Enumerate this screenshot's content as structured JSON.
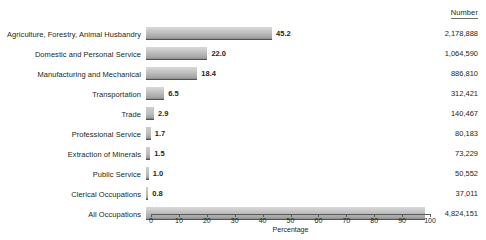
{
  "chart_data": {
    "type": "bar",
    "orientation": "horizontal",
    "title": "",
    "xlabel": "Percentage",
    "ylabel": "",
    "xlim": [
      0,
      100
    ],
    "grid": false,
    "legend": null,
    "number_column_header": "Number",
    "categories": [
      "Agriculture, Forestry, Animal Husbandry",
      "Domestic and Personal Service",
      "Manufacturing and Mechanical",
      "Transportation",
      "Trade",
      "Professional Service",
      "Extraction of Minerals",
      "Public Service",
      "Clerical Occupations",
      "All Occupations"
    ],
    "values": [
      45.2,
      22.0,
      18.4,
      6.5,
      2.9,
      1.7,
      1.5,
      1.0,
      0.8,
      100.0
    ],
    "value_labels": [
      "45.2",
      "22.0",
      "18.4",
      "6.5",
      "2.9",
      "1.7",
      "1.5",
      "1.0",
      "0.8",
      ""
    ],
    "numbers": [
      "2,178,888",
      "1,064,590",
      "886,810",
      "312,421",
      "140,467",
      "80,183",
      "73,229",
      "50,552",
      "37,011",
      "4,824,151"
    ],
    "xticks": [
      0,
      10,
      20,
      30,
      40,
      50,
      60,
      70,
      80,
      90,
      100
    ],
    "xtick_labels": [
      "0",
      "10",
      "20",
      "30",
      "40",
      "50",
      "60",
      "70",
      "80",
      "90",
      "100"
    ],
    "bar_color_top": "#d9d9d9",
    "bar_color_bottom": "#4a4a4a",
    "text_color": "#231f20",
    "axis_color": "#58595b"
  },
  "rows": [
    {
      "label": "Agriculture, Forestry, Animal Husbandry",
      "value": 45.2,
      "value_label": "45.2",
      "number": "2,178,888"
    },
    {
      "label": "Domestic and Personal Service",
      "value": 22.0,
      "value_label": "22.0",
      "number": "1,064,590"
    },
    {
      "label": "Manufacturing and Mechanical",
      "value": 18.4,
      "value_label": "18.4",
      "number": "886,810"
    },
    {
      "label": "Transportation",
      "value": 6.5,
      "value_label": "6.5",
      "number": "312,421"
    },
    {
      "label": "Trade",
      "value": 2.9,
      "value_label": "2.9",
      "number": "140,467"
    },
    {
      "label": "Professional Service",
      "value": 1.7,
      "value_label": "1.7",
      "number": "80,183"
    },
    {
      "label": "Extraction of Minerals",
      "value": 1.5,
      "value_label": "1.5",
      "number": "73,229"
    },
    {
      "label": "Public Service",
      "value": 1.0,
      "value_label": "1.0",
      "number": "50,552"
    },
    {
      "label": "Clerical Occupations",
      "value": 0.8,
      "value_label": "0.8",
      "number": "37,011"
    },
    {
      "label": "All Occupations",
      "value": 100.0,
      "value_label": "",
      "number": "4,824,151"
    }
  ],
  "header": {
    "number_label": "Number"
  },
  "axis": {
    "title": "Percentage",
    "ticks": [
      "0",
      "10",
      "20",
      "30",
      "40",
      "50",
      "60",
      "70",
      "80",
      "90",
      "100"
    ]
  }
}
